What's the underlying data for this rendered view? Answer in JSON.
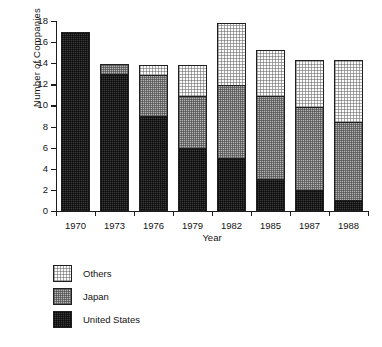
{
  "chart_data": {
    "type": "bar",
    "subtype": "stacked-vertical",
    "title": "",
    "xlabel": "Year",
    "ylabel": "Number of Companies",
    "categories": [
      "1970",
      "1973",
      "1976",
      "1979",
      "1982",
      "1985",
      "1987",
      "1988"
    ],
    "series": [
      {
        "name": "United States",
        "color": "#3a3a3a",
        "values": [
          17,
          13,
          9,
          6,
          5,
          3,
          2,
          1
        ]
      },
      {
        "name": "Japan",
        "color": "#b4b4b4",
        "values": [
          0,
          1,
          4,
          5,
          7,
          8,
          8,
          7.5
        ]
      },
      {
        "name": "Others",
        "color": "#fbfbfb",
        "values": [
          0,
          0,
          1,
          3,
          6,
          4.5,
          4.5,
          6
        ]
      }
    ],
    "totals": [
      17,
      14,
      14,
      14,
      18,
      15.5,
      14.5,
      14.5
    ],
    "ylim": [
      0,
      18
    ],
    "yticks": [
      0,
      2,
      4,
      6,
      8,
      10,
      12,
      14,
      16,
      18
    ],
    "ytick_labels": [
      "0",
      "2",
      "4",
      "6",
      "8",
      "10",
      "12",
      "14",
      "16",
      "18"
    ],
    "grid": false,
    "legend_position": "below-left",
    "legend_order_top_to_bottom": [
      "Others",
      "Japan",
      "United States"
    ]
  },
  "axes": {
    "y_title": "Number of Companies",
    "x_title": "Year"
  },
  "legend": {
    "items": [
      {
        "label": "Others",
        "swatch": "dotted-light-swatch"
      },
      {
        "label": "Japan",
        "swatch": "checker-gray-swatch"
      },
      {
        "label": "United States",
        "swatch": "checker-dark-swatch"
      }
    ]
  }
}
